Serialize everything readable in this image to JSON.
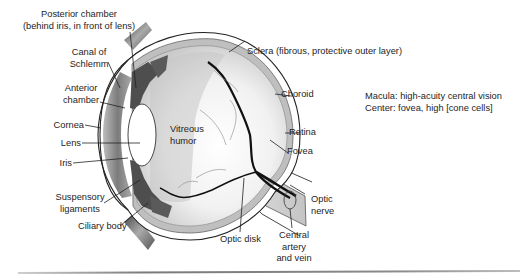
{
  "diagram": {
    "labels": {
      "posterior_chamber": [
        "Posterior chamber",
        "(behind iris, in front of lens)"
      ],
      "canal_of_schlemm": [
        "Canal of",
        "Schlemm"
      ],
      "anterior_chamber": [
        "Anterior",
        "chamber"
      ],
      "cornea": "Cornea",
      "lens": "Lens",
      "iris": "Iris",
      "suspensory_ligaments": [
        "Suspensory",
        "ligaments"
      ],
      "ciliary_body": "Ciliary body",
      "vitreous_humor": [
        "Vitreous",
        "humor"
      ],
      "sclera": "Sclera (fibrous, protective outer layer)",
      "choroid": "Choroid",
      "retina": "Retina",
      "fovea": "Fovea",
      "optic_nerve": [
        "Optic",
        "nerve"
      ],
      "optic_disk": "Optic disk",
      "central_artery_vein": [
        "Central",
        "artery",
        "and vein"
      ]
    },
    "annotation": {
      "line1": "Macula: high-acuity central vision",
      "line2": "Center: fovea, high [cone cells]"
    },
    "colors": {
      "line": "#1a1a1a",
      "vessel": "#111111",
      "tissue_dark": "#5a5a5a",
      "tissue_mid": "#9a9a9a",
      "tissue_light": "#d4d4d4",
      "background": "#ffffff"
    }
  }
}
